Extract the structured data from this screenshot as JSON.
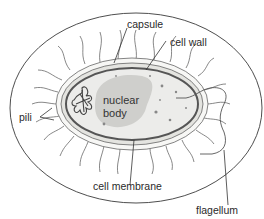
{
  "diagram": {
    "labels": {
      "capsule": "capsule",
      "cell_wall": "cell wall",
      "nuclear_body_line1": "nuclear",
      "nuclear_body_line2": "body",
      "pili": "pili",
      "cell_membrane": "cell membrane",
      "flagellum": "flagellum"
    },
    "colors": {
      "outline": "#3a3a3a",
      "capsule_fill": "#f7f7f5",
      "wall_fill": "#e4e4e0",
      "cytoplasm_fill": "#ececea",
      "nuclear_fill": "#cfcfcc",
      "membrane": "#555555"
    }
  }
}
